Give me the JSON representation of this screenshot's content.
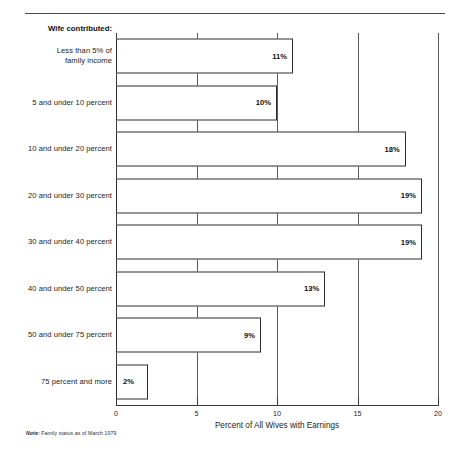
{
  "footnote": {
    "label": "Note:",
    "text": "Family status as of March 1979"
  },
  "chart_data": {
    "type": "bar",
    "orientation": "horizontal",
    "title": "",
    "series_header": "Wife contributed:",
    "xlabel": "Percent of All Wives with Earnings",
    "ylabel": "",
    "xlim": [
      0,
      20
    ],
    "xticks": [
      0,
      5,
      10,
      15,
      20
    ],
    "xticklabels": [
      "0",
      "5",
      "10",
      "15",
      "20"
    ],
    "grid": true,
    "legend": "none",
    "categories": [
      "Less than 5% of\nfamily income",
      "5 and under 10 percent",
      "10 and under 20 percent",
      "20 and under 30 percent",
      "30 and under 40 percent",
      "40 and under 50 percent",
      "50 and under 75 percent",
      "75 percent and more"
    ],
    "values": [
      11,
      10,
      18,
      19,
      19,
      13,
      9,
      2
    ],
    "value_labels": [
      "11%",
      "10%",
      "18%",
      "19%",
      "19%",
      "13%",
      "9%",
      "2%"
    ],
    "bar_face_color": "#ffffff",
    "bar_edge_color": "#2c2c2c"
  }
}
